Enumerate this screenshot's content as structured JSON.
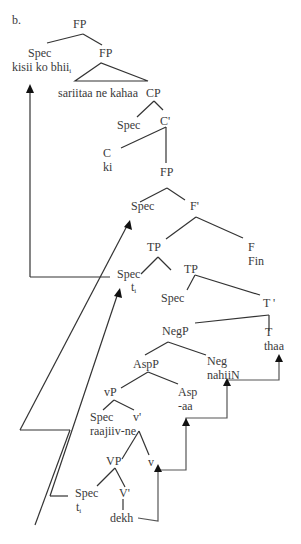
{
  "example_label": "b.",
  "nodes": {
    "fp_root": "FP",
    "spec_top": "Spec",
    "spec_top_word": "kisii ko bhii",
    "spec_top_index": "i",
    "fp2": "FP",
    "triangle_text": "sariitaa ne kahaa",
    "cp": "CP",
    "cp_spec": "Spec",
    "c_bar": "C'",
    "c_head": "C",
    "c_word": "ki",
    "fp3": "FP",
    "fp3_spec": "Spec",
    "f_bar": "F'",
    "tp1": "TP",
    "f_head": "F",
    "f_word": "Fin",
    "tp_spec": "Spec",
    "tp_spec_trace": "t",
    "tp_spec_trace_index": "i",
    "tp2": "TP",
    "tp2_spec": "Spec",
    "t_bar": "T '",
    "negp": "NegP",
    "t_head": "T",
    "t_word": "thaa",
    "aspp": "AspP",
    "neg_head": "Neg",
    "neg_word": "nahiiN",
    "vp_small": "vP",
    "asp_head": "Asp",
    "asp_word": "-aa",
    "vp_small_spec": "Spec",
    "vp_small_spec_word": "raajiiv-ne",
    "v_small_bar": "v'",
    "vp_big": "VP",
    "v_small_head": "v",
    "vp_big_spec": "Spec",
    "vp_big_spec_trace": "t",
    "vp_big_spec_trace_index": "i",
    "v_big_bar": "V'",
    "v_word": "dekh"
  },
  "colors": {
    "line": "#333333",
    "text": "#3a3a3a",
    "arrow_gray": "#555555"
  }
}
